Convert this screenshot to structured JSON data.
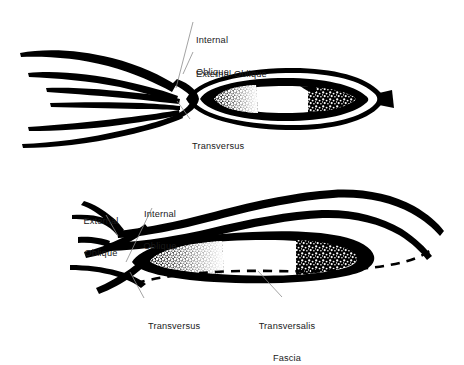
{
  "figure": {
    "background_color": "#ffffff",
    "ink_color": "#000000",
    "leader_line_color": "#8c8c8c",
    "text_color": "#1a1a1a"
  },
  "panels": [
    {
      "id": "upper-panel",
      "name": "upper-cross-section",
      "description": "Upper view: six tapering muscle strands converge from the left into a closed elongated ellipse with a stippled inner ring and a small black stub at the right tip.",
      "labels": [
        {
          "id": "internal-oblique",
          "text": "Internal\nOblique",
          "line1": "Internal",
          "line2": "Oblique",
          "x": 196,
          "y": 14,
          "align": "left"
        },
        {
          "id": "external-oblique",
          "text": "External Oblique",
          "line1": "External Oblique",
          "line2": "",
          "x": 196,
          "y": 48,
          "align": "left"
        },
        {
          "id": "transversus",
          "text": "Transversus",
          "line1": "Transversus",
          "line2": "",
          "x": 192,
          "y": 120,
          "align": "left"
        }
      ]
    },
    {
      "id": "lower-panel",
      "name": "lower-cross-section",
      "description": "Lower view: branching muscle strands from the left sweep right into two long arcing bands above a stippled black blob, with a dashed transversalis fascia line beneath.",
      "labels": [
        {
          "id": "external-oblique-lower",
          "text": "External\nOblique",
          "line1": "External",
          "line2": "Oblique",
          "x": 100,
          "y": 195,
          "align": "center"
        },
        {
          "id": "internal-oblique-lower",
          "text": "Internal\nOblique",
          "line1": "Internal",
          "line2": "Oblique",
          "x": 152,
          "y": 188,
          "align": "center"
        },
        {
          "id": "transversus-lower",
          "text": "Transversus",
          "line1": "Transversus",
          "line2": "",
          "x": 148,
          "y": 300,
          "align": "left"
        },
        {
          "id": "transversalis-fascia",
          "text": "Transversalis\nFascia",
          "line1": "Transversalis",
          "line2": "Fascia",
          "x": 287,
          "y": 300,
          "align": "center"
        }
      ]
    }
  ]
}
